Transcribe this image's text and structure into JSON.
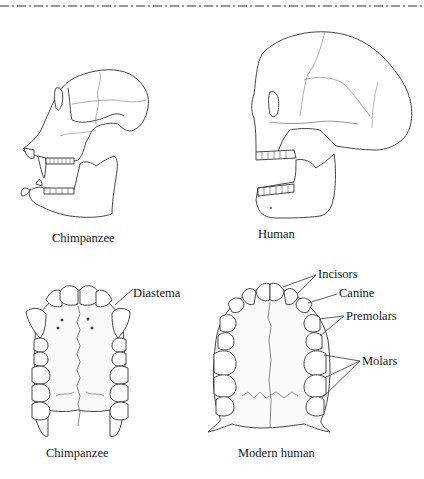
{
  "figure": {
    "panels": [
      {
        "id": "chimp-skull",
        "caption": "Chimpanzee"
      },
      {
        "id": "human-skull",
        "caption": "Human"
      },
      {
        "id": "chimp-palate",
        "caption": "Chimpanzee",
        "labels": [
          "Diastema"
        ]
      },
      {
        "id": "human-palate",
        "caption": "Modern human",
        "labels": [
          "Incisors",
          "Canine",
          "Premolars",
          "Molars"
        ]
      }
    ]
  },
  "captions": {
    "chimp_skull": "Chimpanzee",
    "human_skull": "Human",
    "chimp_palate": "Chimpanzee",
    "human_palate": "Modern human"
  },
  "annotations": {
    "diastema": "Diastema",
    "incisors": "Incisors",
    "canine": "Canine",
    "premolars": "Premolars",
    "molars": "Molars"
  }
}
